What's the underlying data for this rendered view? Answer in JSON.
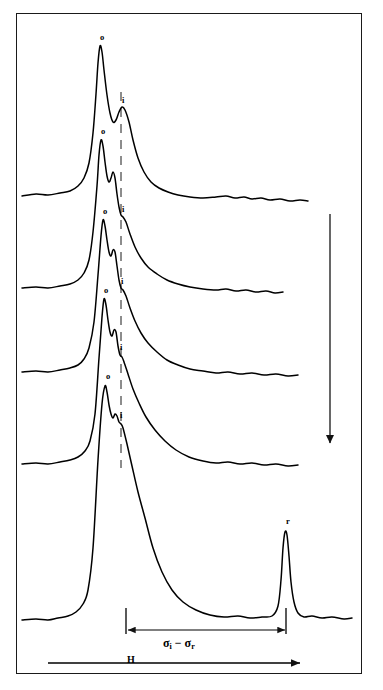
{
  "figure": {
    "type": "stacked-spectra",
    "background": "#ffffff",
    "ink_color": "#000000",
    "frame": {
      "x": 16,
      "y": 13,
      "width": 346,
      "height": 661,
      "border_color": "#1a1a1a"
    }
  },
  "axis": {
    "field_label": "H",
    "field_arrow": {
      "x1": 48,
      "x2": 300,
      "y": 663,
      "direction": "right"
    },
    "separation_label_prefix": "σ",
    "separation_label": "σi − σr",
    "separation_arrow": {
      "x1": 128,
      "x2": 285,
      "y": 630,
      "direction": "both"
    },
    "tick_left_x": 126,
    "tick_right_x": 286,
    "tick_top_y": 608,
    "tick_bottom_y": 634
  },
  "time_arrow": {
    "name": "downward-progression-arrow",
    "x": 330,
    "y1": 214,
    "y2": 443,
    "direction": "down"
  },
  "dashed_guide": {
    "name": "i-peak-guide-line",
    "x": 121,
    "y1": 92,
    "y2": 468,
    "style": "dashed"
  },
  "peak_labels": [
    {
      "text": "o",
      "x": 100,
      "y": 33
    },
    {
      "text": "i",
      "x": 122,
      "y": 96
    },
    {
      "text": "o",
      "x": 101,
      "y": 127
    },
    {
      "text": "i",
      "x": 122,
      "y": 205
    },
    {
      "text": "o",
      "x": 103,
      "y": 207
    },
    {
      "text": "i",
      "x": 121,
      "y": 277
    },
    {
      "text": "o",
      "x": 104,
      "y": 286
    },
    {
      "text": "i",
      "x": 120,
      "y": 343
    },
    {
      "text": "o",
      "x": 106,
      "y": 372
    },
    {
      "text": "i",
      "x": 120,
      "y": 411
    },
    {
      "text": "r",
      "x": 286,
      "y": 517
    }
  ],
  "chart_data": {
    "type": "line",
    "title": "",
    "xlabel": "H",
    "ylabel": "",
    "annotation": "σi − σr",
    "grid": false,
    "legend": "none",
    "xlim": [
      16,
      362
    ],
    "series": [
      {
        "name": "trace-1",
        "baseline_y": 196,
        "o_peak": {
          "x": 100,
          "y": 45,
          "label": "o"
        },
        "i_peak": {
          "x": 122,
          "y": 107,
          "label": "i"
        },
        "points": [
          [
            22,
            196
          ],
          [
            36,
            194
          ],
          [
            48,
            195
          ],
          [
            60,
            193
          ],
          [
            70,
            191
          ],
          [
            78,
            186
          ],
          [
            84,
            178
          ],
          [
            89,
            163
          ],
          [
            93,
            133
          ],
          [
            96,
            94
          ],
          [
            98,
            63
          ],
          [
            100,
            46
          ],
          [
            102,
            52
          ],
          [
            104,
            70
          ],
          [
            107,
            95
          ],
          [
            110,
            113
          ],
          [
            113,
            122
          ],
          [
            116,
            120
          ],
          [
            119,
            112
          ],
          [
            122,
            107
          ],
          [
            125,
            110
          ],
          [
            129,
            122
          ],
          [
            133,
            140
          ],
          [
            138,
            158
          ],
          [
            144,
            172
          ],
          [
            151,
            182
          ],
          [
            159,
            188
          ],
          [
            168,
            192
          ],
          [
            178,
            195
          ],
          [
            190,
            197
          ],
          [
            203,
            198
          ],
          [
            216,
            197
          ],
          [
            226,
            196
          ],
          [
            235,
            198
          ],
          [
            244,
            197
          ],
          [
            252,
            199
          ],
          [
            261,
            198
          ],
          [
            270,
            200
          ],
          [
            280,
            199
          ],
          [
            290,
            201
          ],
          [
            300,
            200
          ],
          [
            308,
            201
          ]
        ]
      },
      {
        "name": "trace-2",
        "baseline_y": 288,
        "o_peak": {
          "x": 101,
          "y": 139,
          "label": "o"
        },
        "i_peak": {
          "x": 122,
          "y": 216,
          "label": "i"
        },
        "points": [
          [
            22,
            288
          ],
          [
            36,
            287
          ],
          [
            48,
            288
          ],
          [
            60,
            286
          ],
          [
            70,
            284
          ],
          [
            78,
            280
          ],
          [
            84,
            273
          ],
          [
            89,
            260
          ],
          [
            93,
            232
          ],
          [
            97,
            186
          ],
          [
            99,
            155
          ],
          [
            101,
            140
          ],
          [
            103,
            146
          ],
          [
            105,
            162
          ],
          [
            107,
            176
          ],
          [
            109,
            182
          ],
          [
            111,
            178
          ],
          [
            113,
            172
          ],
          [
            115,
            178
          ],
          [
            117,
            194
          ],
          [
            119,
            207
          ],
          [
            121,
            215
          ],
          [
            123,
            217
          ],
          [
            126,
            222
          ],
          [
            130,
            234
          ],
          [
            135,
            247
          ],
          [
            141,
            258
          ],
          [
            148,
            267
          ],
          [
            157,
            274
          ],
          [
            167,
            280
          ],
          [
            178,
            284
          ],
          [
            190,
            287
          ],
          [
            203,
            289
          ],
          [
            216,
            290
          ],
          [
            226,
            289
          ],
          [
            236,
            291
          ],
          [
            246,
            290
          ],
          [
            256,
            292
          ],
          [
            266,
            291
          ],
          [
            275,
            293
          ],
          [
            283,
            292
          ]
        ]
      },
      {
        "name": "trace-3",
        "baseline_y": 372,
        "o_peak": {
          "x": 103,
          "y": 219,
          "label": "o"
        },
        "i_peak": {
          "x": 121,
          "y": 288,
          "label": "i"
        },
        "points": [
          [
            22,
            372
          ],
          [
            36,
            371
          ],
          [
            48,
            372
          ],
          [
            60,
            370
          ],
          [
            70,
            368
          ],
          [
            78,
            365
          ],
          [
            84,
            359
          ],
          [
            89,
            348
          ],
          [
            94,
            322
          ],
          [
            98,
            275
          ],
          [
            101,
            236
          ],
          [
            103,
            220
          ],
          [
            105,
            226
          ],
          [
            107,
            240
          ],
          [
            109,
            252
          ],
          [
            111,
            256
          ],
          [
            113,
            250
          ],
          [
            115,
            252
          ],
          [
            117,
            266
          ],
          [
            119,
            280
          ],
          [
            121,
            288
          ],
          [
            123,
            290
          ],
          [
            126,
            296
          ],
          [
            130,
            308
          ],
          [
            135,
            321
          ],
          [
            141,
            333
          ],
          [
            148,
            343
          ],
          [
            157,
            352
          ],
          [
            167,
            360
          ],
          [
            178,
            365
          ],
          [
            190,
            369
          ],
          [
            203,
            371
          ],
          [
            216,
            373
          ],
          [
            228,
            372
          ],
          [
            240,
            374
          ],
          [
            252,
            373
          ],
          [
            264,
            375
          ],
          [
            276,
            374
          ],
          [
            288,
            376
          ],
          [
            298,
            375
          ]
        ]
      },
      {
        "name": "trace-4",
        "baseline_y": 464,
        "o_peak": {
          "x": 104,
          "y": 298,
          "label": "o"
        },
        "i_peak": {
          "x": 120,
          "y": 354,
          "label": "i"
        },
        "points": [
          [
            22,
            464
          ],
          [
            36,
            463
          ],
          [
            48,
            464
          ],
          [
            60,
            462
          ],
          [
            70,
            460
          ],
          [
            78,
            457
          ],
          [
            85,
            451
          ],
          [
            90,
            441
          ],
          [
            95,
            414
          ],
          [
            99,
            358
          ],
          [
            102,
            317
          ],
          [
            104,
            299
          ],
          [
            106,
            305
          ],
          [
            108,
            320
          ],
          [
            110,
            332
          ],
          [
            112,
            336
          ],
          [
            114,
            330
          ],
          [
            116,
            332
          ],
          [
            118,
            346
          ],
          [
            120,
            355
          ],
          [
            122,
            357
          ],
          [
            124,
            362
          ],
          [
            128,
            374
          ],
          [
            133,
            389
          ],
          [
            139,
            403
          ],
          [
            146,
            417
          ],
          [
            155,
            430
          ],
          [
            165,
            441
          ],
          [
            176,
            450
          ],
          [
            189,
            457
          ],
          [
            203,
            461
          ],
          [
            216,
            463
          ],
          [
            228,
            462
          ],
          [
            240,
            464
          ],
          [
            252,
            463
          ],
          [
            264,
            465
          ],
          [
            276,
            464
          ],
          [
            288,
            466
          ],
          [
            298,
            465
          ]
        ]
      },
      {
        "name": "trace-5",
        "baseline_y": 620,
        "o_peak": {
          "x": 106,
          "y": 384,
          "label": "o"
        },
        "i_peak": {
          "x": 120,
          "y": 422,
          "label": "i"
        },
        "r_peak": {
          "x": 286,
          "y": 529,
          "label": "r"
        },
        "points": [
          [
            22,
            620
          ],
          [
            36,
            619
          ],
          [
            48,
            620
          ],
          [
            58,
            618
          ],
          [
            68,
            616
          ],
          [
            76,
            612
          ],
          [
            83,
            604
          ],
          [
            88,
            590
          ],
          [
            93,
            548
          ],
          [
            98,
            460
          ],
          [
            102,
            404
          ],
          [
            105,
            386
          ],
          [
            107,
            392
          ],
          [
            109,
            405
          ],
          [
            111,
            414
          ],
          [
            113,
            418
          ],
          [
            115,
            414
          ],
          [
            117,
            416
          ],
          [
            119,
            422
          ],
          [
            121,
            424
          ],
          [
            123,
            428
          ],
          [
            127,
            444
          ],
          [
            132,
            466
          ],
          [
            138,
            492
          ],
          [
            145,
            518
          ],
          [
            153,
            548
          ],
          [
            162,
            572
          ],
          [
            172,
            590
          ],
          [
            183,
            602
          ],
          [
            196,
            610
          ],
          [
            210,
            615
          ],
          [
            224,
            617
          ],
          [
            238,
            616
          ],
          [
            250,
            618
          ],
          [
            262,
            617
          ],
          [
            272,
            616
          ],
          [
            278,
            606
          ],
          [
            281,
            580
          ],
          [
            283,
            548
          ],
          [
            285,
            532
          ],
          [
            287,
            535
          ],
          [
            289,
            556
          ],
          [
            291,
            582
          ],
          [
            294,
            602
          ],
          [
            298,
            613
          ],
          [
            304,
            617
          ],
          [
            312,
            616
          ],
          [
            322,
            618
          ],
          [
            332,
            617
          ],
          [
            344,
            619
          ],
          [
            352,
            618
          ]
        ]
      }
    ]
  }
}
